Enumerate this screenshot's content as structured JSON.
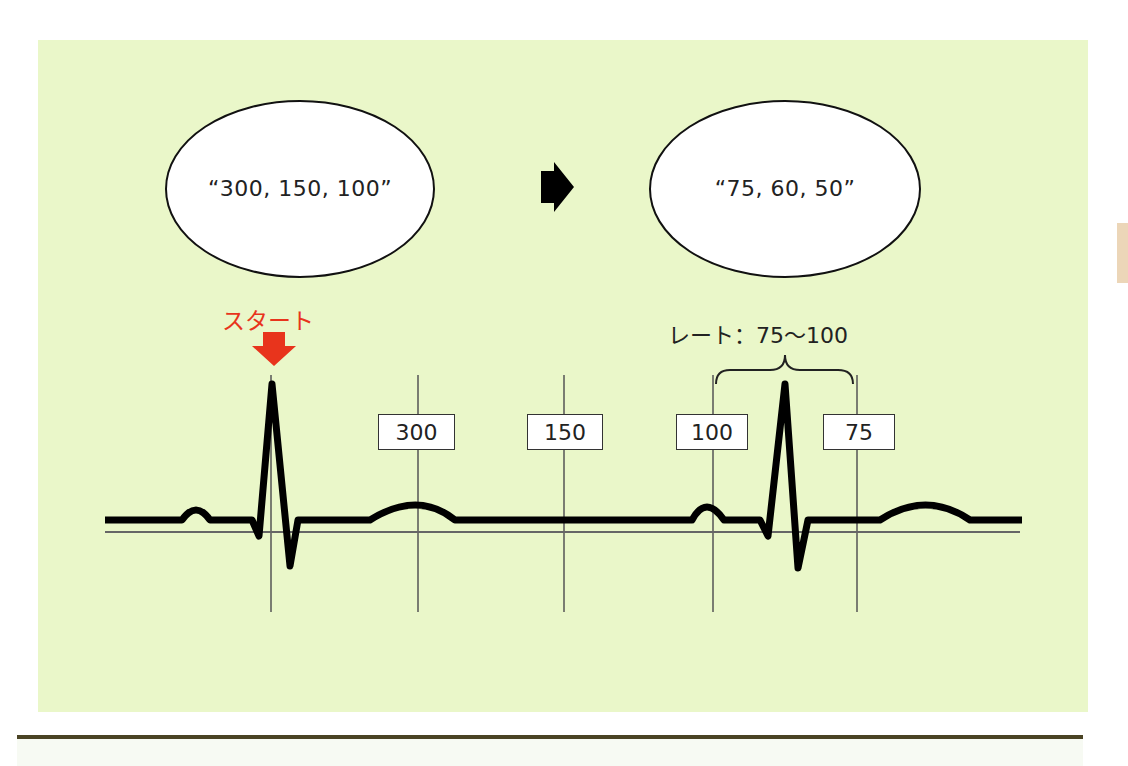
{
  "diagram": {
    "background_color": "#eaf7c9",
    "ellipses": [
      {
        "text": "“300, 150, 100”"
      },
      {
        "text": "“75, 60, 50”"
      }
    ],
    "arrow_between_ellipses": "right-arrow",
    "start_marker": {
      "label": "スタート",
      "color": "#e8341c"
    },
    "rate_annotation": {
      "label": "レート：75〜100"
    },
    "gridline_labels": [
      {
        "label": "300"
      },
      {
        "label": "150"
      },
      {
        "label": "100"
      },
      {
        "label": "75"
      }
    ],
    "trace": "ECG waveform with two QRS complexes; first R wave at start line, second R wave between 100 and 75 lines"
  }
}
